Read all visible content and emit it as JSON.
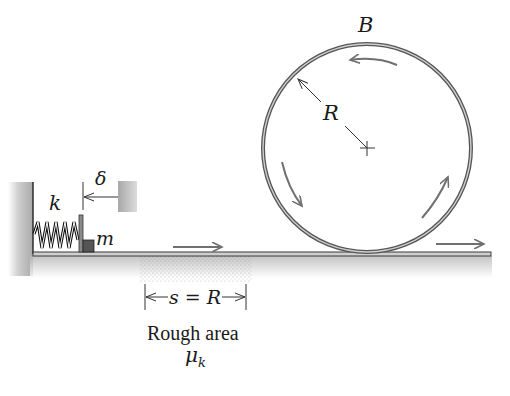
{
  "figure": {
    "labels": {
      "top_point": "B",
      "radius": "R",
      "spring_constant": "k",
      "mass": "m",
      "compression": "δ",
      "distance": "s = R",
      "rough_area": "Rough area",
      "friction_coefficient_main": "μ",
      "friction_coefficient_sub": "k"
    },
    "colors": {
      "ink": "#1a1a1a",
      "track": "#6e6e6e",
      "arrow": "#707070",
      "shade": "#bdbdbd",
      "block": "#555555"
    },
    "geometry": {
      "loop_center": [
        367,
        148
      ],
      "loop_radius": 105,
      "ground_y": 254,
      "rough_span_x": [
        145,
        246
      ]
    },
    "motion_arrows": [
      {
        "name": "ground-left",
        "direction": "right"
      },
      {
        "name": "loop-left",
        "direction": "down"
      },
      {
        "name": "loop-top",
        "direction": "left"
      },
      {
        "name": "loop-right",
        "direction": "up"
      },
      {
        "name": "exit",
        "direction": "right"
      }
    ]
  }
}
